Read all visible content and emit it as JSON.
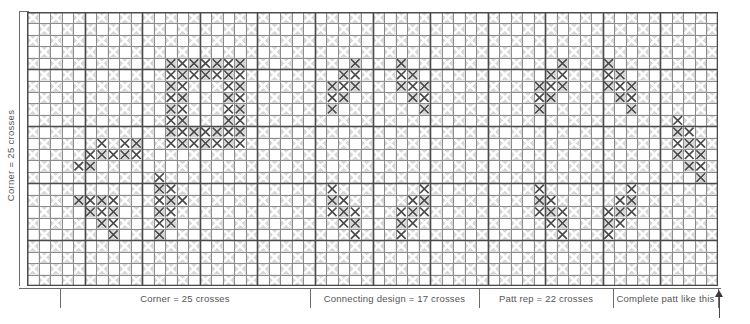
{
  "colors": {
    "stitch": "#4a4a4a",
    "grid_minor": "#8c8c8c",
    "grid_major": "#4a4a4a",
    "cell_shade": "#d6d6d6",
    "cell_light": "#ffffff",
    "weave_x": "#ffffff",
    "text": "#555555",
    "background": "#ffffff"
  },
  "axis": {
    "left_label": "Corner = 25 crosses",
    "segments": [
      {
        "name": "corner",
        "label": "Corner = 25 crosses"
      },
      {
        "name": "connecting",
        "label": "Connecting design = 17 crosses"
      },
      {
        "name": "pattern-repeat",
        "label": "Patt rep = 22 crosses"
      },
      {
        "name": "complete",
        "label": "Complete patt like this"
      }
    ]
  },
  "chart_data": {
    "type": "heatmap",
    "xlabel": "",
    "ylabel": "Corner = 25 crosses",
    "grid": true,
    "cols": 60,
    "rows": 24,
    "cell_px": 11.52,
    "major_every": 5,
    "legend": [],
    "annotations": [
      "Corner = 25 crosses",
      "Connecting design = 17 crosses",
      "Patt rep = 22 crosses",
      "Complete patt like this"
    ],
    "segment_boundaries_col": [
      3,
      24,
      39,
      51,
      60
    ],
    "stitches": [
      {
        "r": 4,
        "c": [
          12,
          13,
          14,
          15,
          16,
          17,
          18
        ]
      },
      {
        "r": 5,
        "c": [
          12,
          13,
          14,
          15,
          16,
          17,
          18
        ]
      },
      {
        "r": 6,
        "c": [
          12,
          13,
          17,
          18
        ]
      },
      {
        "r": 7,
        "c": [
          12,
          13,
          17,
          18
        ]
      },
      {
        "r": 8,
        "c": [
          12,
          13,
          17,
          18
        ]
      },
      {
        "r": 9,
        "c": [
          12,
          13,
          17,
          18
        ]
      },
      {
        "r": 10,
        "c": [
          12,
          13,
          14,
          15,
          16,
          17,
          18
        ]
      },
      {
        "r": 11,
        "c": [
          12,
          13,
          14,
          15,
          16,
          17,
          18
        ]
      },
      {
        "r": 4,
        "c": [
          28
        ]
      },
      {
        "r": 5,
        "c": [
          27,
          28
        ]
      },
      {
        "r": 6,
        "c": [
          26,
          27,
          28
        ]
      },
      {
        "r": 7,
        "c": [
          26,
          27
        ]
      },
      {
        "r": 8,
        "c": [
          26
        ]
      },
      {
        "r": 4,
        "c": [
          32
        ]
      },
      {
        "r": 5,
        "c": [
          32,
          33
        ]
      },
      {
        "r": 6,
        "c": [
          32,
          33,
          34
        ]
      },
      {
        "r": 7,
        "c": [
          33,
          34
        ]
      },
      {
        "r": 8,
        "c": [
          34
        ]
      },
      {
        "r": 4,
        "c": [
          46
        ]
      },
      {
        "r": 5,
        "c": [
          45,
          46
        ]
      },
      {
        "r": 6,
        "c": [
          44,
          45,
          46
        ]
      },
      {
        "r": 7,
        "c": [
          44,
          45
        ]
      },
      {
        "r": 8,
        "c": [
          44
        ]
      },
      {
        "r": 4,
        "c": [
          50
        ]
      },
      {
        "r": 5,
        "c": [
          50,
          51
        ]
      },
      {
        "r": 6,
        "c": [
          50,
          51,
          52
        ]
      },
      {
        "r": 7,
        "c": [
          51,
          52
        ]
      },
      {
        "r": 8,
        "c": [
          52
        ]
      },
      {
        "r": 11,
        "c": [
          6
        ]
      },
      {
        "r": 12,
        "c": [
          5,
          6
        ]
      },
      {
        "r": 13,
        "c": [
          4,
          5
        ]
      },
      {
        "r": 12,
        "c": [
          7,
          8,
          9
        ]
      },
      {
        "r": 11,
        "c": [
          8,
          9
        ]
      },
      {
        "r": 15,
        "c": [
          26
        ]
      },
      {
        "r": 16,
        "c": [
          26,
          27
        ]
      },
      {
        "r": 17,
        "c": [
          26,
          27,
          28
        ]
      },
      {
        "r": 18,
        "c": [
          27,
          28
        ]
      },
      {
        "r": 19,
        "c": [
          28
        ]
      },
      {
        "r": 15,
        "c": [
          34
        ]
      },
      {
        "r": 16,
        "c": [
          33,
          34
        ]
      },
      {
        "r": 17,
        "c": [
          32,
          33,
          34
        ]
      },
      {
        "r": 18,
        "c": [
          32,
          33
        ]
      },
      {
        "r": 19,
        "c": [
          32
        ]
      },
      {
        "r": 15,
        "c": [
          44
        ]
      },
      {
        "r": 16,
        "c": [
          44,
          45
        ]
      },
      {
        "r": 17,
        "c": [
          44,
          45,
          46
        ]
      },
      {
        "r": 18,
        "c": [
          45,
          46
        ]
      },
      {
        "r": 19,
        "c": [
          46
        ]
      },
      {
        "r": 15,
        "c": [
          52
        ]
      },
      {
        "r": 16,
        "c": [
          51,
          52
        ]
      },
      {
        "r": 17,
        "c": [
          50,
          51,
          52
        ]
      },
      {
        "r": 18,
        "c": [
          50,
          51
        ]
      },
      {
        "r": 19,
        "c": [
          50
        ]
      },
      {
        "r": 16,
        "c": [
          4,
          5,
          6,
          7
        ]
      },
      {
        "r": 17,
        "c": [
          5,
          6,
          7
        ]
      },
      {
        "r": 18,
        "c": [
          6,
          7
        ]
      },
      {
        "r": 19,
        "c": [
          7
        ]
      },
      {
        "r": 14,
        "c": [
          11
        ]
      },
      {
        "r": 15,
        "c": [
          11,
          12
        ]
      },
      {
        "r": 16,
        "c": [
          11,
          12,
          13
        ]
      },
      {
        "r": 17,
        "c": [
          11,
          12
        ]
      },
      {
        "r": 18,
        "c": [
          11,
          12
        ]
      },
      {
        "r": 19,
        "c": [
          11
        ]
      },
      {
        "r": 9,
        "c": [
          56
        ]
      },
      {
        "r": 10,
        "c": [
          56,
          57
        ]
      },
      {
        "r": 11,
        "c": [
          56,
          57,
          58
        ]
      },
      {
        "r": 12,
        "c": [
          56,
          57,
          58
        ]
      },
      {
        "r": 13,
        "c": [
          57,
          58
        ]
      },
      {
        "r": 14,
        "c": [
          58
        ]
      }
    ]
  }
}
